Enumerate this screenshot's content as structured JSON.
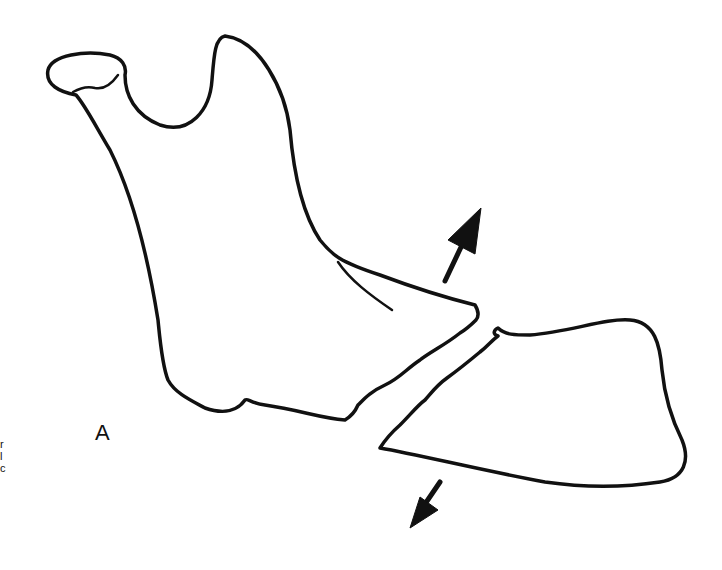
{
  "figure": {
    "panel_label": "A",
    "edge_text": [
      "r",
      "l",
      "c"
    ],
    "arrows": [
      {
        "name": "upward-displacement",
        "direction": "up-right"
      },
      {
        "name": "downward-displacement",
        "direction": "down-left"
      }
    ],
    "colors": {
      "stroke": "#111111",
      "background": "#ffffff"
    }
  }
}
